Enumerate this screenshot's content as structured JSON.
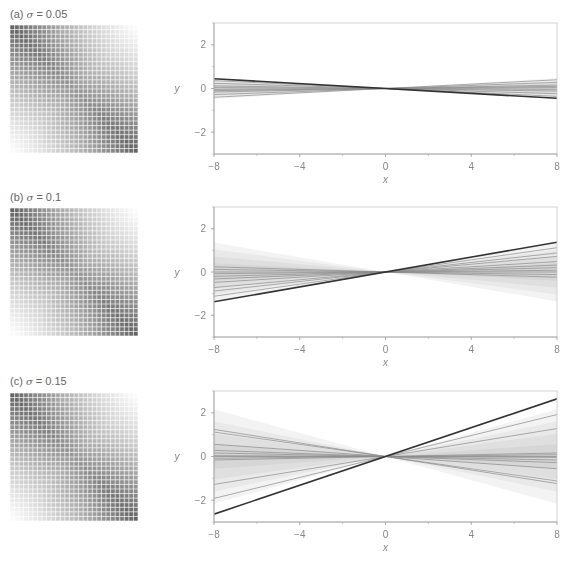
{
  "figure": {
    "panels": [
      {
        "label_prefix": "(a) ",
        "sigma_symbol": "σ",
        "label_suffix": " = 0.05"
      },
      {
        "label_prefix": "(b) ",
        "sigma_symbol": "σ",
        "label_suffix": " = 0.1"
      },
      {
        "label_prefix": "(c) ",
        "sigma_symbol": "σ",
        "label_suffix": " = 0.15"
      }
    ]
  },
  "chart_data": [
    {
      "type": "line",
      "title": "(a) σ = 0.05",
      "xlabel": "x",
      "ylabel": "y",
      "xlim": [
        -8,
        8
      ],
      "ylim": [
        -3,
        3
      ],
      "xticks": [
        -8,
        -4,
        0,
        4,
        8
      ],
      "yticks": [
        -2,
        0,
        2
      ],
      "x_minor_ticks": [
        -6,
        -2,
        2,
        6
      ],
      "y_minor_ticks": [
        -3,
        -1,
        1,
        3
      ],
      "true_line": {
        "slope": -0.056,
        "color": "#333333"
      },
      "sample_slopes": [
        0.05,
        0.035,
        0.02,
        0.012,
        0.005,
        -0.005,
        -0.015,
        -0.03,
        -0.045
      ],
      "band_halfwidth_slopes": [
        0.06,
        0.045,
        0.03,
        0.015
      ],
      "grid": false
    },
    {
      "type": "line",
      "title": "(b) σ = 0.1",
      "xlabel": "x",
      "ylabel": "y",
      "xlim": [
        -8,
        8
      ],
      "ylim": [
        -3,
        3
      ],
      "xticks": [
        -8,
        -4,
        0,
        4,
        8
      ],
      "yticks": [
        -2,
        0,
        2
      ],
      "x_minor_ticks": [
        -6,
        -2,
        2,
        6
      ],
      "y_minor_ticks": [
        -3,
        -1,
        1,
        3
      ],
      "true_line": {
        "slope": 0.172,
        "color": "#333333"
      },
      "sample_slopes": [
        0.14,
        0.11,
        0.09,
        0.06,
        0.04,
        0.025,
        0.01,
        0.0,
        -0.015,
        -0.03
      ],
      "band_halfwidth_slopes": [
        0.17,
        0.13,
        0.09,
        0.05
      ],
      "grid": false
    },
    {
      "type": "line",
      "title": "(c) σ = 0.15",
      "xlabel": "x",
      "ylabel": "y",
      "xlim": [
        -8,
        8
      ],
      "ylim": [
        -3,
        3
      ],
      "xticks": [
        -8,
        -4,
        0,
        4,
        8
      ],
      "yticks": [
        -2,
        0,
        2
      ],
      "x_minor_ticks": [
        -6,
        -2,
        2,
        6
      ],
      "y_minor_ticks": [
        -3,
        -1,
        1,
        3
      ],
      "true_line": {
        "slope": 0.33,
        "color": "#333333"
      },
      "sample_slopes": [
        0.24,
        0.16,
        0.02,
        0.01,
        0.0,
        -0.005,
        -0.02,
        -0.035,
        -0.07,
        -0.14,
        -0.155
      ],
      "band_halfwidth_slopes": [
        0.27,
        0.2,
        0.13,
        0.07
      ],
      "grid": false
    }
  ]
}
